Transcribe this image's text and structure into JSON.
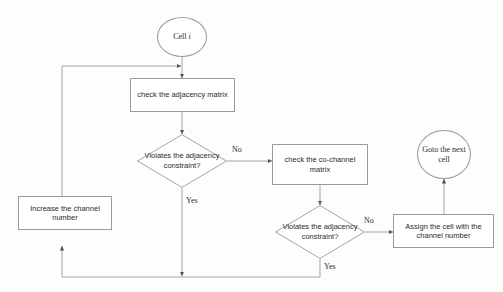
{
  "diagram": {
    "line_color": "#9a9a9a",
    "text_color": "#2b2b2b",
    "background": "#fdfdfd"
  },
  "nodes": {
    "start": {
      "label_prefix": "Cell ",
      "label_italic": "i",
      "shape": "circle"
    },
    "check_adjacency": {
      "label": "check the adjacency matrix",
      "shape": "rect"
    },
    "decision_adjacency_1": {
      "label": "Violates the adjacency constraint?",
      "shape": "diamond"
    },
    "check_cochannel": {
      "label": "check the co-channel matrix",
      "shape": "rect"
    },
    "decision_adjacency_2": {
      "label": "Violates the adjacency constraint?",
      "shape": "diamond"
    },
    "increase_channel": {
      "label": "Increase the channel number",
      "shape": "rect"
    },
    "assign_cell": {
      "label": "Assign the cell with the channel number",
      "shape": "rect"
    },
    "goto_next": {
      "label": "Goto the next cell",
      "shape": "circle"
    }
  },
  "edge_labels": {
    "no_1": "No",
    "yes_1": "Yes",
    "no_2": "No",
    "yes_2": "Yes"
  }
}
